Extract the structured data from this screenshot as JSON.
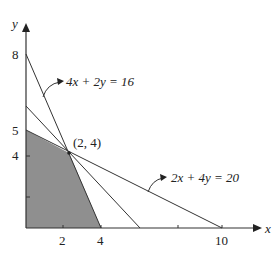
{
  "axes": {
    "x_label": "x",
    "y_label": "y"
  },
  "x_ticks": [
    "2",
    "4",
    "10"
  ],
  "y_ticks": [
    "8",
    "5",
    "4"
  ],
  "constraints": [
    {
      "label": "4x + 2y = 16"
    },
    {
      "label": "2x + 4y = 20"
    }
  ],
  "point_label": "(2, 4)",
  "colors": {
    "feasible_region": "#8c8c8c",
    "lines": "#333333"
  }
}
